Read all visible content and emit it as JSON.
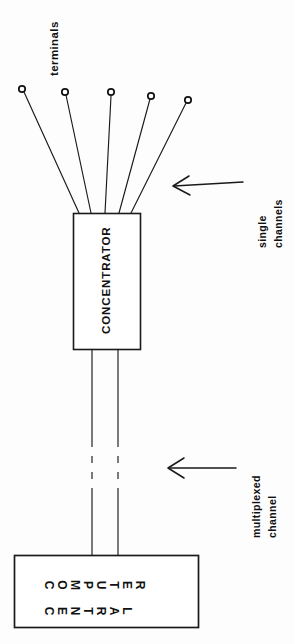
{
  "diagram": {
    "background_color": "#fdfdfd",
    "stroke_color": "#1a1a1a",
    "labels": {
      "terminals": "terminals",
      "single_channels_line1": "single",
      "single_channels_line2": "channels",
      "multiplexed_line1": "multiplexed",
      "multiplexed_line2": "channel",
      "concentrator": "CONCENTRATOR",
      "central_box_line1": "COMPUTER",
      "central_box_line2": "CENTRAL"
    },
    "terminals": [
      {
        "id": "terminal-1",
        "cx": 22,
        "cy": 89,
        "r": 3.2
      },
      {
        "id": "terminal-2",
        "cx": 65,
        "cy": 92,
        "r": 3.2
      },
      {
        "id": "terminal-3",
        "cx": 111,
        "cy": 92,
        "r": 3.2
      },
      {
        "id": "terminal-4",
        "cx": 151,
        "cy": 96,
        "r": 3.2
      },
      {
        "id": "terminal-5",
        "cx": 188,
        "cy": 100,
        "r": 3.2
      }
    ],
    "single_channel_lines": [
      {
        "x1": 24,
        "y1": 92,
        "x2": 79,
        "y2": 213
      },
      {
        "x1": 66,
        "y1": 95,
        "x2": 91,
        "y2": 213
      },
      {
        "x1": 111,
        "y1": 96,
        "x2": 105,
        "y2": 213
      },
      {
        "x1": 150,
        "y1": 99,
        "x2": 119,
        "y2": 213
      },
      {
        "x1": 186,
        "y1": 103,
        "x2": 131,
        "y2": 213
      }
    ],
    "concentrator_box": {
      "x": 73,
      "y": 213,
      "width": 67,
      "height": 136
    },
    "central_box": {
      "x": 14,
      "y": 555,
      "width": 184,
      "height": 72
    },
    "multiplexed_lines": [
      {
        "x": 92,
        "solid_top_end": 440,
        "dash_start": 440,
        "dash_end": 492,
        "solid_bottom_start": 492
      },
      {
        "x": 118,
        "solid_top_end": 440,
        "dash_start": 440,
        "dash_end": 492,
        "solid_bottom_start": 492
      }
    ],
    "arrows": [
      {
        "id": "arrow-single-channels",
        "tip_x": 173,
        "tip_y": 186,
        "tail_x": 243,
        "tail_y": 182
      },
      {
        "id": "arrow-multiplexed-channel",
        "tip_x": 168,
        "tip_y": 468,
        "tail_x": 236,
        "tail_y": 468
      }
    ]
  }
}
